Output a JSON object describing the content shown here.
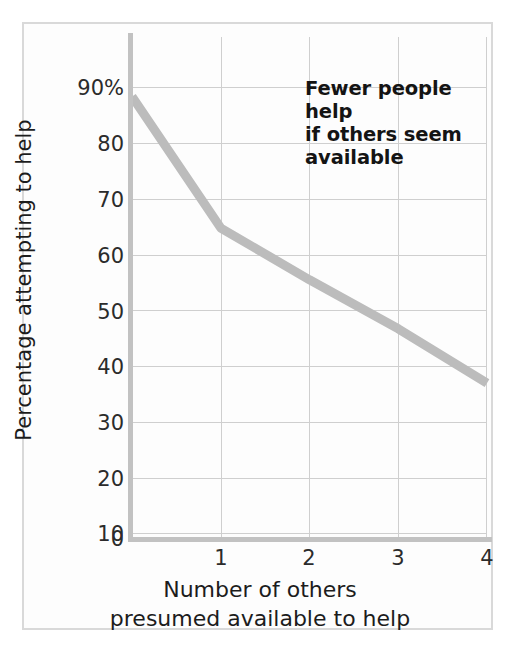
{
  "chart_data": {
    "type": "line",
    "title": "",
    "subtitle": "",
    "xlabel": "Number of others presumed available to help",
    "xlabel_line1": "Number of others",
    "xlabel_line2": "presumed available to help",
    "ylabel": "Percentage attempting to help",
    "x": [
      0,
      1,
      2,
      3,
      4
    ],
    "values": [
      85.5,
      60,
      50,
      40.5,
      30
    ],
    "series": [
      {
        "name": "Percentage attempting to help",
        "values": [
          85.5,
          60,
          50,
          40.5,
          30
        ]
      }
    ],
    "xlim": [
      0,
      4
    ],
    "ylim": [
      0,
      97
    ],
    "x_tick_labels": [
      "1",
      "2",
      "3",
      "4"
    ],
    "x_tick_values": [
      1,
      2,
      3,
      4
    ],
    "y_tick_labels": [
      "0",
      "10",
      "20",
      "30",
      "40",
      "50",
      "60",
      "70",
      "80",
      "90%"
    ],
    "y_tick_values": [
      0,
      10,
      20,
      30,
      40,
      50,
      60,
      70,
      80,
      90
    ],
    "grid": true,
    "grid_axes": "both",
    "legend": false,
    "legend_position": "none",
    "annotations": [
      {
        "text": "Fewer people help if others seem available",
        "lines": [
          "Fewer people help",
          "if others seem",
          "available"
        ],
        "position": "top-right"
      }
    ],
    "colors": {
      "line": "#bcbcbc",
      "grid": "#cfcfcf",
      "axis": "#c2c2c2",
      "frame": "#d9d9d9",
      "text": "#1c1c1c",
      "background": "#ffffff"
    },
    "line_width_px": 9
  }
}
